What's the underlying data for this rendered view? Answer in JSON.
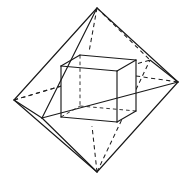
{
  "figure": {
    "caption": "",
    "style": {
      "background_color": "#ffffff",
      "line_color": "#1a1a1a",
      "hidden_line_color": "#2b2b2b",
      "line_width": 1.15,
      "hidden_dash_pattern": "4.2 3.4"
    },
    "canvas": {
      "width": 186,
      "height": 185
    }
  },
  "octahedron": {
    "name": "octahedron",
    "vertex_count": 6,
    "edge_count": 12,
    "vertices": {
      "top": {
        "label": "top-apex",
        "x": 97,
        "y": 8,
        "hidden": false
      },
      "bottom": {
        "label": "bottom-apex",
        "x": 97,
        "y": 172,
        "hidden": false
      },
      "left": {
        "label": "left",
        "x": 14,
        "y": 100,
        "hidden": false
      },
      "right": {
        "label": "right",
        "x": 178,
        "y": 82,
        "hidden": false
      },
      "front": {
        "label": "front",
        "x": 42,
        "y": 118,
        "hidden": false
      },
      "back": {
        "label": "back",
        "x": 150,
        "y": 60,
        "hidden": false
      }
    },
    "edges": [
      {
        "from": "top",
        "to": "left",
        "hidden": false
      },
      {
        "from": "top",
        "to": "right",
        "hidden": false
      },
      {
        "from": "top",
        "to": "front",
        "hidden": false
      },
      {
        "from": "top",
        "to": "back",
        "hidden": true
      },
      {
        "from": "bottom",
        "to": "left",
        "hidden": false
      },
      {
        "from": "bottom",
        "to": "right",
        "hidden": false
      },
      {
        "from": "bottom",
        "to": "front",
        "hidden": false
      },
      {
        "from": "bottom",
        "to": "back",
        "hidden": true
      },
      {
        "from": "left",
        "to": "front",
        "hidden": false
      },
      {
        "from": "front",
        "to": "right",
        "hidden": false
      },
      {
        "from": "right",
        "to": "back",
        "hidden": false
      },
      {
        "from": "back",
        "to": "left",
        "hidden": true
      }
    ]
  },
  "cube": {
    "name": "inscribed-cube",
    "vertex_count": 8,
    "edge_count": 12,
    "vertices": {
      "front_top_left": {
        "label": "front-top-left",
        "x": 61,
        "y": 66,
        "hidden": false
      },
      "front_top_right": {
        "label": "front-top-right",
        "x": 117,
        "y": 71,
        "hidden": false
      },
      "front_bottom_right": {
        "label": "front-bottom-right",
        "x": 117,
        "y": 122,
        "hidden": false
      },
      "front_bottom_left": {
        "label": "front-bottom-left",
        "x": 61,
        "y": 117,
        "hidden": false
      },
      "back_top_left": {
        "label": "back-top-left",
        "x": 80,
        "y": 55,
        "hidden": false
      },
      "back_top_right": {
        "label": "back-top-right",
        "x": 136,
        "y": 60,
        "hidden": false
      },
      "back_bottom_right": {
        "label": "back-bottom-right",
        "x": 136,
        "y": 111,
        "hidden": false
      },
      "back_bottom_left": {
        "label": "back-bottom-left",
        "x": 80,
        "y": 106,
        "hidden": true
      }
    },
    "edges": [
      {
        "from": "front_top_left",
        "to": "front_top_right",
        "hidden": false
      },
      {
        "from": "front_top_right",
        "to": "front_bottom_right",
        "hidden": false
      },
      {
        "from": "front_bottom_right",
        "to": "front_bottom_left",
        "hidden": false
      },
      {
        "from": "front_bottom_left",
        "to": "front_top_left",
        "hidden": false
      },
      {
        "from": "back_top_left",
        "to": "back_top_right",
        "hidden": false
      },
      {
        "from": "back_top_right",
        "to": "back_bottom_right",
        "hidden": false
      },
      {
        "from": "back_bottom_right",
        "to": "back_bottom_left",
        "hidden": true
      },
      {
        "from": "back_bottom_left",
        "to": "back_top_left",
        "hidden": true
      },
      {
        "from": "front_top_left",
        "to": "back_top_left",
        "hidden": false
      },
      {
        "from": "front_top_right",
        "to": "back_top_right",
        "hidden": false
      },
      {
        "from": "front_bottom_right",
        "to": "back_bottom_right",
        "hidden": false
      },
      {
        "from": "front_bottom_left",
        "to": "back_bottom_left",
        "hidden": true
      }
    ]
  }
}
